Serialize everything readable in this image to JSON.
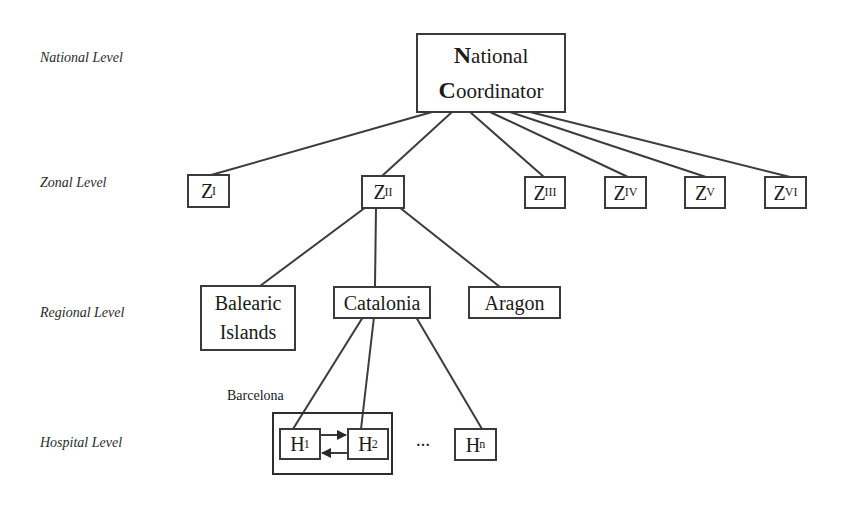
{
  "levels": {
    "national": "National Level",
    "zonal": "Zonal Level",
    "regional": "Regional Level",
    "hospital": "Hospital Level"
  },
  "national_coordinator": {
    "line1_initial": "N",
    "line1_rest": "ational",
    "line2_initial": "C",
    "line2_rest": "oordinator"
  },
  "zones": [
    {
      "letter": "Z",
      "sub": "I"
    },
    {
      "letter": "Z",
      "sub": "II"
    },
    {
      "letter": "Z",
      "sub": "III"
    },
    {
      "letter": "Z",
      "sub": "IV"
    },
    {
      "letter": "Z",
      "sub": "V"
    },
    {
      "letter": "Z",
      "sub": "VI"
    }
  ],
  "regions": [
    {
      "line1": "Balearic",
      "line2": "Islands"
    },
    {
      "label": "Catalonia"
    },
    {
      "label": "Aragon"
    }
  ],
  "hospital_group": {
    "label": "Barcelona"
  },
  "hospitals": [
    {
      "letter": "H",
      "sub": "1"
    },
    {
      "letter": "H",
      "sub": "2"
    },
    {
      "letter": "H",
      "sub": "n"
    }
  ],
  "ellipsis": "…",
  "colors": {
    "stroke": "#3a3a3a",
    "background": "#ffffff",
    "text": "#1a1a1a"
  }
}
